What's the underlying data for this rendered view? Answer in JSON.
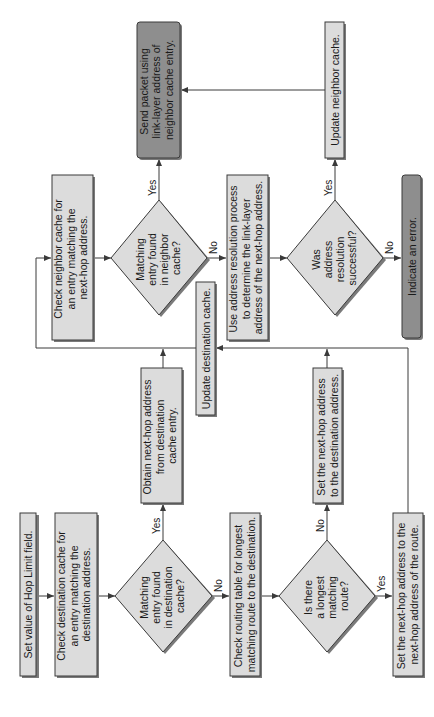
{
  "diagram": {
    "type": "flowchart",
    "orientation": "rotated-90-ccw",
    "colors": {
      "process_fill": "#dcdcdc",
      "terminal_fill": "#8e8e8e",
      "stroke": "#3a3a3a"
    },
    "nodes": {
      "set_hop_limit": {
        "lines": [
          "Set value of Hop Limit field."
        ]
      },
      "check_dest_cache": {
        "lines": [
          "Check destination cache for",
          "an entry matching the",
          "destination address."
        ]
      },
      "dest_cache_decision": {
        "lines": [
          "Matching",
          "entry found",
          "in destination",
          "cache?"
        ]
      },
      "obtain_next_hop": {
        "lines": [
          "Obtain next-hop address",
          "from destination",
          "cache entry."
        ]
      },
      "check_routing_table": {
        "lines": [
          "Check routing table for longest",
          "matching route to the destination."
        ]
      },
      "longest_route_decision": {
        "lines": [
          "Is there",
          "a longest",
          "matching",
          "route?"
        ]
      },
      "set_next_hop_dest": {
        "lines": [
          "Set the next-hop address",
          "to the destination address."
        ]
      },
      "set_next_hop_route": {
        "lines": [
          "Set the next-hop address to the",
          "next-hop address of the route."
        ]
      },
      "update_dest_cache": {
        "lines": [
          "Update destination cache."
        ]
      },
      "check_neighbor_cache": {
        "lines": [
          "Check neighbor cache for",
          "an entry matching the",
          "next-hop address."
        ]
      },
      "neighbor_cache_decision": {
        "lines": [
          "Matching",
          "entry found",
          "in neighbor",
          "cache?"
        ]
      },
      "send_packet": {
        "lines": [
          "Send packet using",
          "link-layer address of",
          "neighbor cache entry."
        ]
      },
      "address_resolution": {
        "lines": [
          "Use address resolution process",
          "to determine the link-layer",
          "address of the next-hop address."
        ]
      },
      "resolution_decision": {
        "lines": [
          "Was",
          "address",
          "resolution",
          "successful?"
        ]
      },
      "update_neighbor_cache": {
        "lines": [
          "Update neighbor cache."
        ]
      },
      "indicate_error": {
        "lines": [
          "Indicate an error."
        ]
      }
    },
    "edge_labels": {
      "dest_yes": "Yes",
      "dest_no": "No",
      "route_no": "No",
      "route_yes": "Yes",
      "neighbor_yes": "Yes",
      "neighbor_no": "No",
      "resolution_yes": "Yes",
      "resolution_no": "No"
    }
  }
}
